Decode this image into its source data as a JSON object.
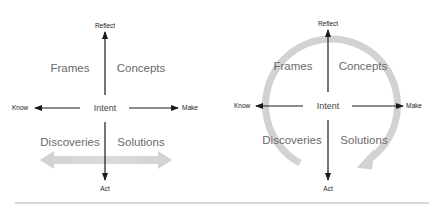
{
  "diagrams": [
    {
      "id": "left",
      "axes": {
        "top": "Reflect",
        "bottom": "Act",
        "left": "Know",
        "right": "Make"
      },
      "center": "Intent",
      "quadrants": {
        "top_left": "Frames",
        "top_right": "Concepts",
        "bottom_left": "Discoveries",
        "bottom_right": "Solutions"
      },
      "overlay": "horizontal-double-arrow"
    },
    {
      "id": "right",
      "axes": {
        "top": "Reflect",
        "bottom": "Act",
        "left": "Know",
        "right": "Make"
      },
      "center": "Intent",
      "quadrants": {
        "top_left": "Frames",
        "top_right": "Concepts",
        "bottom_left": "Discoveries",
        "bottom_right": "Solutions"
      },
      "overlay": "clockwise-circular-arrow"
    }
  ],
  "colors": {
    "axis": "#1a1a1a",
    "quadrant_text": "#6a6a6a",
    "overlay_arrow": "#d0d0d0",
    "divider": "#9a9a9a"
  }
}
